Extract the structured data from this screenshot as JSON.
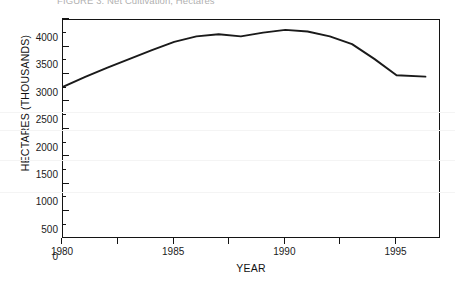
{
  "figure": {
    "title": "FIGURE 3. Net Cultivation, Hectares",
    "xlabel": "YEAR",
    "ylabel": "HECTARES (THOUSANDS)"
  },
  "axes": {
    "y_tick_labels": [
      "4000",
      "3500",
      "3000",
      "2500",
      "2000",
      "1500",
      "1000",
      "500",
      "0"
    ],
    "x_tick_labels": [
      "1980",
      "1985",
      "1990",
      "1995"
    ]
  },
  "chart_data": {
    "type": "line",
    "title": "FIGURE 3. Net Cultivation, Hectares",
    "xlabel": "YEAR",
    "ylabel": "HECTARES (THOUSANDS)",
    "xlim": [
      1980,
      1997
    ],
    "ylim": [
      0,
      4000
    ],
    "y_major_step": 500,
    "y_minor_step": 250,
    "x_major_step": 2.5,
    "x_labeled_step": 5,
    "grid": false,
    "legend": null,
    "line_color": "#1a1a1a",
    "x": [
      1980,
      1981,
      1982,
      1983,
      1984,
      1985,
      1986,
      1987,
      1988,
      1989,
      1990,
      1991,
      1992,
      1993,
      1994,
      1995,
      1996.3
    ],
    "values": [
      2780,
      2960,
      3130,
      3290,
      3450,
      3600,
      3700,
      3740,
      3700,
      3770,
      3820,
      3790,
      3700,
      3560,
      3290,
      2990,
      2965
    ],
    "series": [
      {
        "name": "Net cultivation",
        "values": [
          2780,
          2960,
          3130,
          3290,
          3450,
          3600,
          3700,
          3740,
          3700,
          3770,
          3820,
          3790,
          3700,
          3560,
          3290,
          2990,
          2965
        ]
      }
    ]
  }
}
